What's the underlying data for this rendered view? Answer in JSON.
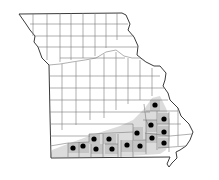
{
  "map": {
    "subject": "Missouri county distribution map",
    "colors": {
      "background": "#ffffff",
      "county_line": "#6b6b6b",
      "outline": "#3a3a3a",
      "range_shade": "#d6d6d6",
      "county_shade": "#bdbdbd",
      "dot": "#000000"
    },
    "dots": [
      {
        "x": 155,
        "y": 105
      },
      {
        "x": 164,
        "y": 119
      },
      {
        "x": 151,
        "y": 125
      },
      {
        "x": 164,
        "y": 132
      },
      {
        "x": 137,
        "y": 133
      },
      {
        "x": 152,
        "y": 138
      },
      {
        "x": 164,
        "y": 143
      },
      {
        "x": 94,
        "y": 139
      },
      {
        "x": 109,
        "y": 139
      },
      {
        "x": 127,
        "y": 145
      },
      {
        "x": 140,
        "y": 146
      },
      {
        "x": 73,
        "y": 148
      },
      {
        "x": 83,
        "y": 146
      },
      {
        "x": 96,
        "y": 149
      },
      {
        "x": 112,
        "y": 149
      }
    ]
  }
}
